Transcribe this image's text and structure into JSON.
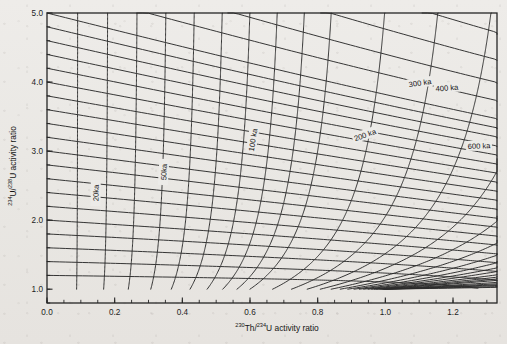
{
  "figure": {
    "name": "u-series-isochron-diagram",
    "background_color": "#ebe9e6",
    "line_color": "#2b2b2b",
    "frame_color": "#262626"
  },
  "axes": {
    "x": {
      "label_pre": "230",
      "label_mid": "Th/",
      "label_sup2": "234",
      "label_post": "U  activity  ratio",
      "label_plain": "230Th/234U activity ratio",
      "min": 0.0,
      "max": 1.33,
      "major_ticks": [
        0.0,
        0.2,
        0.4,
        0.6,
        0.8,
        1.0,
        1.2
      ],
      "major_tick_labels": [
        "0.0",
        "0.2",
        "0.4",
        "0.6",
        "0.8",
        "1.0",
        "1.2"
      ],
      "minor_tick_step": 0.05
    },
    "y": {
      "label_pre": "234",
      "label_mid": "U/",
      "label_sup2": "238",
      "label_post": "U activity ratio",
      "label_plain": "234U/238U activity ratio",
      "min": 0.8,
      "max": 5.0,
      "major_ticks": [
        1.0,
        2.0,
        3.0,
        4.0,
        5.0
      ],
      "major_tick_labels": [
        "1.0",
        "2.0",
        "3.0",
        "4.0",
        "5.0"
      ],
      "minor_tick_step": 0.2
    }
  },
  "chart_data": {
    "type": "line",
    "title": "",
    "xlabel": "230Th/234U activity ratio",
    "ylabel": "234U/238U activity ratio",
    "xlim": [
      0.0,
      1.33
    ],
    "ylim": [
      0.8,
      5.0
    ],
    "grid": false,
    "legend": "none",
    "decay_constants": {
      "lambda230_per_yr": 9.1577e-06,
      "lambda234_per_yr": 2.8263e-06
    },
    "isochrons_ka": [
      10,
      20,
      30,
      40,
      50,
      60,
      70,
      80,
      90,
      100,
      120,
      140,
      160,
      180,
      200,
      220,
      240,
      260,
      280,
      300,
      325,
      350,
      375,
      400,
      450,
      500,
      550,
      600,
      700,
      800
    ],
    "isochron_labels": [
      {
        "text": "20ka",
        "value_ka": 20,
        "x": 96,
        "y": 193
      },
      {
        "text": "50ka",
        "value_ka": 50,
        "x": 164,
        "y": 172
      },
      {
        "text": "100 ka",
        "value_ka": 100,
        "x": 253,
        "y": 140
      },
      {
        "text": "200 ka",
        "value_ka": 200,
        "x": 365,
        "y": 135
      },
      {
        "text": "300 ka",
        "value_ka": 300,
        "x": 420,
        "y": 83
      },
      {
        "text": "400 ka",
        "value_ka": 400,
        "x": 447,
        "y": 88
      },
      {
        "text": "600 ka",
        "value_ka": 600,
        "x": 479,
        "y": 146
      }
    ],
    "initial_234U_238U_curves": [
      1.2,
      1.4,
      1.6,
      1.8,
      2.0,
      2.2,
      2.4,
      2.6,
      2.8,
      3.0,
      3.2,
      3.4,
      3.6,
      3.8,
      4.0,
      4.2,
      4.4,
      4.6,
      4.8,
      5.0,
      5.4,
      5.8,
      6.3,
      6.9,
      7.6,
      8.5,
      9.6
    ]
  }
}
